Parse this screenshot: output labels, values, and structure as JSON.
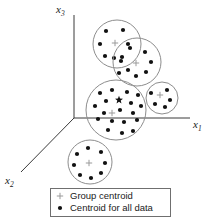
{
  "figure": {
    "title": "",
    "background_color": "#ffffff",
    "width": 218,
    "height": 223
  },
  "axes": {
    "origin": {
      "x": 74,
      "y": 118
    },
    "items": [
      {
        "name": "x1",
        "label_base": "x",
        "label_sub": "1",
        "label_x": 193,
        "label_y": 128,
        "line": {
          "x1": 74,
          "y1": 118,
          "x2": 190,
          "y2": 118
        },
        "direction": "right"
      },
      {
        "name": "x2",
        "label_base": "x",
        "label_sub": "2",
        "label_x": 5,
        "label_y": 184,
        "line": {
          "x1": 74,
          "y1": 118,
          "x2": 21,
          "y2": 172
        },
        "direction": "down-left"
      },
      {
        "name": "x3",
        "label_base": "x",
        "label_sub": "3",
        "label_x": 56,
        "label_y": 13,
        "line": {
          "x1": 74,
          "y1": 118,
          "x2": 74,
          "y2": 15
        },
        "direction": "up"
      }
    ],
    "axis_color": "#3a3a3a"
  },
  "colors": {
    "dot": "#111111",
    "circle": "#8d8d8d",
    "axis": "#3a3a3a",
    "centroid_plus": "#9a9a9a",
    "legend_border": "#6f6f6f",
    "text": "#1a1a1a"
  },
  "chart_data": {
    "type": "scatter",
    "title": "",
    "xlabel": "x1",
    "ylabel": "x3",
    "zlabel": "x2",
    "grid": false,
    "legend_position": "bottom",
    "dot_radius": 2.1,
    "clusters": [
      {
        "name": "cluster-top",
        "center": {
          "x": 117,
          "y": 44
        },
        "radius": 24,
        "group_centroid": {
          "x": 115,
          "y": 43
        },
        "points": [
          {
            "x": 106,
            "y": 31
          },
          {
            "x": 123,
            "y": 30
          },
          {
            "x": 100,
            "y": 44
          },
          {
            "x": 128,
            "y": 44
          },
          {
            "x": 105,
            "y": 56
          },
          {
            "x": 122,
            "y": 57
          },
          {
            "x": 114,
            "y": 58
          }
        ]
      },
      {
        "name": "cluster-upper-right",
        "center": {
          "x": 137,
          "y": 62
        },
        "radius": 24,
        "group_centroid": {
          "x": 136,
          "y": 63
        },
        "points": [
          {
            "x": 130,
            "y": 48
          },
          {
            "x": 145,
            "y": 52
          },
          {
            "x": 121,
            "y": 61
          },
          {
            "x": 151,
            "y": 62
          },
          {
            "x": 128,
            "y": 70
          },
          {
            "x": 146,
            "y": 72
          },
          {
            "x": 136,
            "y": 76
          },
          {
            "x": 119,
            "y": 73
          }
        ]
      },
      {
        "name": "cluster-center-large",
        "center": {
          "x": 116,
          "y": 110
        },
        "radius": 30,
        "group_centroid": {
          "x": 112,
          "y": 113
        },
        "overall_centroid": {
          "x": 119,
          "y": 100
        },
        "points": [
          {
            "x": 100,
            "y": 93
          },
          {
            "x": 112,
            "y": 90
          },
          {
            "x": 127,
            "y": 92
          },
          {
            "x": 138,
            "y": 95
          },
          {
            "x": 106,
            "y": 101
          },
          {
            "x": 95,
            "y": 106
          },
          {
            "x": 131,
            "y": 103
          },
          {
            "x": 141,
            "y": 106
          },
          {
            "x": 104,
            "y": 113
          },
          {
            "x": 120,
            "y": 110
          },
          {
            "x": 133,
            "y": 113
          },
          {
            "x": 98,
            "y": 119
          },
          {
            "x": 112,
            "y": 121
          },
          {
            "x": 124,
            "y": 122
          },
          {
            "x": 137,
            "y": 120
          },
          {
            "x": 108,
            "y": 130
          },
          {
            "x": 122,
            "y": 133
          },
          {
            "x": 133,
            "y": 131
          }
        ]
      },
      {
        "name": "cluster-right-small",
        "center": {
          "x": 162,
          "y": 98
        },
        "radius": 16,
        "group_centroid": {
          "x": 160,
          "y": 95
        },
        "points": [
          {
            "x": 151,
            "y": 93
          },
          {
            "x": 167,
            "y": 90
          },
          {
            "x": 170,
            "y": 100
          },
          {
            "x": 155,
            "y": 104
          },
          {
            "x": 165,
            "y": 107
          }
        ]
      },
      {
        "name": "cluster-bottom",
        "center": {
          "x": 90,
          "y": 162
        },
        "radius": 22,
        "group_centroid": {
          "x": 89,
          "y": 163
        },
        "points": [
          {
            "x": 88,
            "y": 148
          },
          {
            "x": 101,
            "y": 152
          },
          {
            "x": 77,
            "y": 154
          },
          {
            "x": 105,
            "y": 163
          },
          {
            "x": 74,
            "y": 165
          },
          {
            "x": 101,
            "y": 173
          },
          {
            "x": 80,
            "y": 175
          },
          {
            "x": 91,
            "y": 178
          }
        ]
      }
    ]
  },
  "legend": {
    "box": {
      "x": 50,
      "y": 188,
      "width": 120,
      "height": 28
    },
    "entries": [
      {
        "name": "legend-group-centroid",
        "marker": "plus",
        "label": "Group centroid",
        "marker_x": 60,
        "marker_y": 196,
        "text_x": 70,
        "text_y": 199
      },
      {
        "name": "legend-overall-centroid",
        "marker": "dot",
        "label": "Centroid for all data",
        "marker_x": 60,
        "marker_y": 208,
        "text_x": 70,
        "text_y": 211
      }
    ]
  }
}
